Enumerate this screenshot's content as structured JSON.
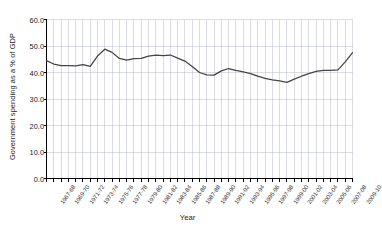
{
  "chart_data": {
    "type": "line",
    "title": "",
    "xlabel": "Year",
    "ylabel": "Government spending as a % of GDP",
    "ylim": [
      0,
      60
    ],
    "yticks": [
      "0.0",
      "10.0",
      "20.0",
      "30.0",
      "40.0",
      "50.0",
      "60.0"
    ],
    "ytick_values": [
      0,
      10,
      20,
      30,
      40,
      50,
      60
    ],
    "grid": true,
    "legend": false,
    "line_color": "#444444",
    "grid_color": "#b9b9c9",
    "axis_color": "#000000",
    "categories": [
      "1967-68",
      "1968-69",
      "1969-70",
      "1970-71",
      "1971-72",
      "1972-73",
      "1973-74",
      "1974-75",
      "1975-76",
      "1976-77",
      "1977-78",
      "1978-79",
      "1979-80",
      "1980-81",
      "1981-82",
      "1982-83",
      "1983-84",
      "1984-85",
      "1985-86",
      "1986-87",
      "1987-88",
      "1988-89",
      "1989-90",
      "1990-91",
      "1991-92",
      "1992-93",
      "1993-94",
      "1994-95",
      "1995-96",
      "1996-97",
      "1997-98",
      "1998-99",
      "1999-00",
      "2000-01",
      "2001-02",
      "2002-03",
      "2003-04",
      "2004-05",
      "2005-06",
      "2006-07",
      "2007-08",
      "2008-09",
      "2009-10"
    ],
    "tick_labels_shown": [
      "1967-68",
      "1969-70",
      "1971-72",
      "1973-74",
      "1975-76",
      "1977-78",
      "1979-80",
      "1981-82",
      "1983-84",
      "1985-86",
      "1987-88",
      "1989-90",
      "1991-92",
      "1993-94",
      "1995-96",
      "1997-98",
      "1999-00",
      "2001-02",
      "2003-04",
      "2005-06",
      "2007-08",
      "2009-10"
    ],
    "values": [
      44.5,
      43.2,
      42.6,
      42.6,
      42.5,
      43.0,
      42.3,
      46.2,
      48.8,
      47.6,
      45.3,
      44.7,
      45.2,
      45.3,
      46.2,
      46.6,
      46.4,
      46.6,
      45.4,
      44.3,
      42.3,
      40.0,
      39.1,
      39.0,
      40.6,
      41.5,
      40.8,
      40.2,
      39.6,
      38.6,
      37.8,
      37.2,
      36.8,
      36.3,
      37.5,
      38.6,
      39.6,
      40.4,
      40.8,
      40.8,
      41.0,
      44.0,
      47.5
    ]
  }
}
